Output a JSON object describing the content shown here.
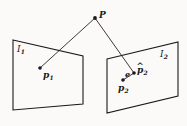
{
  "figure": {
    "type": "epipolar-geometry-diagram",
    "background_color": "#fbfaf8",
    "stroke_color": "#1a1a1a",
    "width": 187,
    "height": 126,
    "planes": [
      {
        "id": "left-image-plane",
        "label": "I",
        "label_subscript": "1",
        "label_x": 17,
        "label_y": 45,
        "corners": "13,40 83,56 83,104 13,110"
      },
      {
        "id": "right-image-plane",
        "label": "I",
        "label_subscript": "2",
        "label_x": 160,
        "label_y": 50,
        "corners": "107,59 178,42 178,96 107,113"
      }
    ],
    "points": [
      {
        "id": "scene-point-P",
        "label": "P",
        "label_subscript": "",
        "hat": false,
        "dot_x": 95,
        "dot_y": 18,
        "label_x": 99,
        "label_y": 11,
        "dot_radius": 1.9
      },
      {
        "id": "image-point-p1",
        "label": "p",
        "label_subscript": "1",
        "hat": false,
        "dot_x": 40,
        "dot_y": 68,
        "label_x": 43,
        "label_y": 71,
        "dot_radius": 1.8
      },
      {
        "id": "image-point-p2",
        "label": "p",
        "label_subscript": "2",
        "hat": false,
        "dot_x": 123,
        "dot_y": 80,
        "label_x": 118,
        "label_y": 84,
        "dot_radius": 1.8
      },
      {
        "id": "estimated-point-p2-hat",
        "label": "p",
        "label_subscript": "2",
        "hat": true,
        "dot_x": 134,
        "dot_y": 73,
        "label_x": 137,
        "label_y": 66,
        "dot_radius": 1.8
      }
    ],
    "segments": [
      {
        "id": "ray-P-to-p1",
        "x1": 95,
        "y1": 18,
        "x2": 40,
        "y2": 68
      },
      {
        "id": "ray-P-to-p2-hat",
        "x1": 95,
        "y1": 18,
        "x2": 134,
        "y2": 73
      },
      {
        "id": "error-vector-e",
        "x1": 123,
        "y1": 80,
        "x2": 134,
        "y2": 73
      }
    ],
    "annotations": [
      {
        "id": "error-label-e",
        "label": "e",
        "label_x": 125,
        "label_y": 70
      }
    ]
  }
}
